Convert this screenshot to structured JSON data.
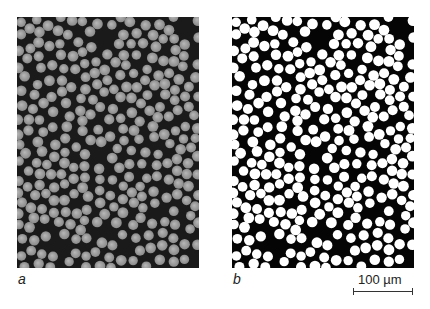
{
  "figure": {
    "panels": [
      {
        "id": "a",
        "label": "a",
        "description": "grayscale micrograph of fiber cross-sections",
        "fiber_color": "#b8b8b8",
        "fiber_edge": "#8a8a8a",
        "matrix_color": "#1a1a1a",
        "seed": 7
      },
      {
        "id": "b",
        "label": "b",
        "description": "binarized micrograph of fiber cross-sections",
        "fiber_color": "#ffffff",
        "fiber_edge": "#ffffff",
        "matrix_color": "#050505",
        "seed": 7
      }
    ],
    "scale_bar": {
      "text": "100 µm",
      "length_px": 60
    },
    "fiber_radius_px": 5.2,
    "fiber_count_target": 900
  }
}
